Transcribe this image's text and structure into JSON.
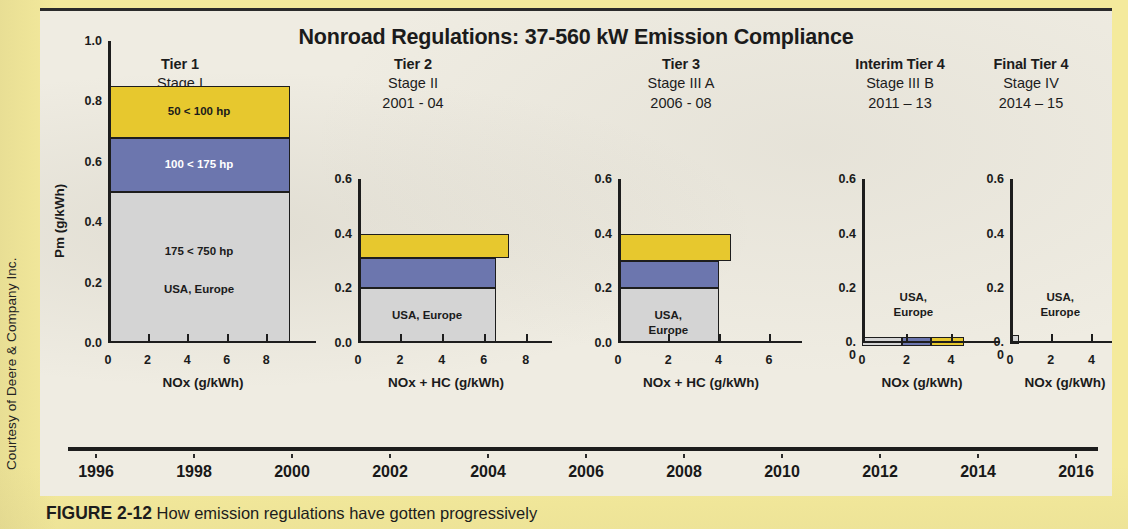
{
  "credit": "Courtesy of Deere & Company Inc.",
  "figure": {
    "title": "Nonroad Regulations: 37-560 kW Emission Compliance",
    "caption_number": "FIGURE 2-12",
    "caption_text": " How emission regulations have gotten progressively"
  },
  "colors": {
    "yellow": "#e7c82e",
    "blue": "#6c76ae",
    "gray": "#d4d4d4",
    "outline": "#1d1d1d",
    "page_background": "#f4ea9c",
    "panel_background": "#efece2"
  },
  "tiers": [
    {
      "name": "Tier 1",
      "stage": "Stage I",
      "years": "1996 - 99"
    },
    {
      "name": "Tier 2",
      "stage": "Stage II",
      "years": "2001 - 04"
    },
    {
      "name": "Tier 3",
      "stage": "Stage III A",
      "years": "2006 - 08"
    },
    {
      "name": "Interim Tier 4",
      "stage": "Stage III B",
      "years": "2011 – 13"
    },
    {
      "name": "Final Tier 4",
      "stage": "Stage IV",
      "years": "2014 – 15"
    }
  ],
  "chart_data": [
    {
      "id": "tier1",
      "type": "bar",
      "title": "Tier 1",
      "xlabel": "NOx (g/kWh)",
      "ylabel": "Pm (g/kWh)",
      "xlim": [
        0,
        9.6
      ],
      "ylim": [
        0,
        1.0
      ],
      "xticks": [
        "0",
        "2",
        "4",
        "6",
        "8"
      ],
      "xtick_values": [
        0,
        2,
        4,
        6,
        8
      ],
      "yticks": [
        "0.0",
        "0.2",
        "0.4",
        "0.6",
        "0.8",
        "1.0"
      ],
      "ytick_values": [
        0.0,
        0.2,
        0.4,
        0.6,
        0.8,
        1.0
      ],
      "bands": [
        {
          "label": "175 < 750 hp",
          "sublabel": "USA, Europe",
          "y0": 0.0,
          "y1": 0.5,
          "x1": 9.2,
          "color": "#d4d4d4",
          "text": "dark"
        },
        {
          "label": "100 < 175 hp",
          "sublabel": "",
          "y0": 0.5,
          "y1": 0.68,
          "x1": 9.2,
          "color": "#6c76ae",
          "text": "light"
        },
        {
          "label": "50 < 100 hp",
          "sublabel": "",
          "y0": 0.68,
          "y1": 0.85,
          "x1": 9.2,
          "color": "#e7c82e",
          "text": "dark"
        }
      ]
    },
    {
      "id": "tier2",
      "type": "bar",
      "title": "Tier 2",
      "xlabel": "NOx + HC (g/kWh)",
      "ylabel": "",
      "xlim": [
        0,
        8.4
      ],
      "ylim": [
        0,
        0.6
      ],
      "xticks": [
        "0",
        "2",
        "4",
        "6",
        "8"
      ],
      "xtick_values": [
        0,
        2,
        4,
        6,
        8
      ],
      "yticks": [
        "0.0",
        "0.2",
        "0.4",
        "0.6"
      ],
      "ytick_values": [
        0.0,
        0.2,
        0.4,
        0.6
      ],
      "bands": [
        {
          "label": "USA, Europe",
          "sublabel": "",
          "y0": 0.0,
          "y1": 0.2,
          "x1": 6.6,
          "color": "#d4d4d4",
          "text": "dark"
        },
        {
          "label": "",
          "sublabel": "",
          "y0": 0.2,
          "y1": 0.31,
          "x1": 6.6,
          "color": "#6c76ae",
          "text": "light"
        },
        {
          "label": "",
          "sublabel": "",
          "y0": 0.31,
          "y1": 0.4,
          "x1": 7.2,
          "color": "#e7c82e",
          "text": "dark"
        }
      ]
    },
    {
      "id": "tier3",
      "type": "bar",
      "title": "Tier 3",
      "xlabel": "NOx + HC (g/kWh)",
      "ylabel": "",
      "xlim": [
        0,
        6.6
      ],
      "ylim": [
        0,
        0.6
      ],
      "xticks": [
        "0",
        "2",
        "4",
        "6"
      ],
      "xtick_values": [
        0,
        2,
        4,
        6
      ],
      "yticks": [
        "0.0",
        "0.2",
        "0.4",
        "0.6"
      ],
      "ytick_values": [
        0.0,
        0.2,
        0.4,
        0.6
      ],
      "bands": [
        {
          "label": "USA,\nEurope",
          "sublabel": "",
          "y0": 0.0,
          "y1": 0.2,
          "x1": 4.0,
          "color": "#d4d4d4",
          "text": "dark"
        },
        {
          "label": "",
          "sublabel": "",
          "y0": 0.2,
          "y1": 0.3,
          "x1": 4.0,
          "color": "#6c76ae",
          "text": "light"
        },
        {
          "label": "",
          "sublabel": "",
          "y0": 0.3,
          "y1": 0.4,
          "x1": 4.5,
          "color": "#e7c82e",
          "text": "dark"
        }
      ]
    },
    {
      "id": "interim-tier4",
      "type": "bar",
      "title": "Interim Tier 4",
      "xlabel": "NOx (g/kWh)",
      "ylabel": "",
      "xlim": [
        0,
        5.4
      ],
      "ylim": [
        0,
        0.6
      ],
      "xticks": [
        "0",
        "2",
        "4"
      ],
      "xtick_values": [
        0,
        2,
        4
      ],
      "yticks": [
        "0.\n0",
        "0.2",
        "0.4",
        "0.6"
      ],
      "ytick_values": [
        0.0,
        0.2,
        0.4,
        0.6
      ],
      "annotation": "USA,\nEurope",
      "segments": [
        {
          "x0": 0.0,
          "x1": 1.8,
          "y1": 0.022,
          "color": "#d4d4d4"
        },
        {
          "x0": 1.8,
          "x1": 3.1,
          "y1": 0.022,
          "color": "#6c76ae"
        },
        {
          "x0": 3.1,
          "x1": 4.6,
          "y1": 0.022,
          "color": "#e7c82e"
        }
      ]
    },
    {
      "id": "final-tier4",
      "type": "bar",
      "title": "Final Tier 4",
      "xlabel": "NOx  (g/kWh)",
      "ylabel": "",
      "xlim": [
        0,
        5.4
      ],
      "ylim": [
        0,
        0.6
      ],
      "xticks": [
        "0",
        "2",
        "4"
      ],
      "xtick_values": [
        0,
        2,
        4
      ],
      "yticks": [
        "0.\n0",
        "0.2",
        "0.4",
        "0.6"
      ],
      "ytick_values": [
        0.0,
        0.2,
        0.4,
        0.6
      ],
      "annotation": "USA,\nEurope",
      "segments": [
        {
          "x0": 0.0,
          "x1": 0.45,
          "y1": 0.028,
          "color": "#d4d4d4"
        }
      ]
    }
  ],
  "timeline": {
    "labels": [
      "1996",
      "1998",
      "2000",
      "2002",
      "2004",
      "2006",
      "2008",
      "2010",
      "2012",
      "2014",
      "2016"
    ]
  }
}
